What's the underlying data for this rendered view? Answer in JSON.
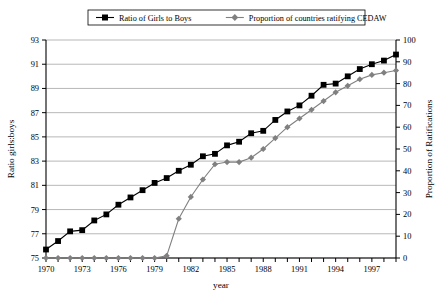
{
  "chart_data": {
    "type": "line",
    "title": "",
    "xlabel": "year",
    "ylabel": "Ratio girls:boys",
    "y2label": "Proportion of Ratifications",
    "grid": true,
    "legend_position": "top",
    "xlim": [
      1970,
      1999
    ],
    "ylim": [
      75,
      93
    ],
    "y2lim": [
      0,
      100
    ],
    "ytick_step": 2,
    "y2tick_step": 10,
    "xtick_step": 1,
    "xlabel_step": 3,
    "x": [
      1970,
      1971,
      1972,
      1973,
      1974,
      1975,
      1976,
      1977,
      1978,
      1979,
      1980,
      1981,
      1982,
      1983,
      1984,
      1985,
      1986,
      1987,
      1988,
      1989,
      1990,
      1991,
      1992,
      1993,
      1994,
      1995,
      1996,
      1997,
      1998,
      1999
    ],
    "xticklabels": [
      "1970",
      "1973",
      "1976",
      "1979",
      "1982",
      "1985",
      "1988",
      "1991",
      "1994",
      "1997"
    ],
    "yticklabels": [
      "75",
      "77",
      "79",
      "81",
      "83",
      "85",
      "87",
      "89",
      "91",
      "93"
    ],
    "y2ticklabels": [
      "0",
      "10",
      "20",
      "30",
      "40",
      "50",
      "60",
      "70",
      "80",
      "90",
      "100"
    ],
    "series": [
      {
        "name": "Ratio of Girls to Boys",
        "axis": "left",
        "color": "#000000",
        "marker": "square",
        "values": [
          75.7,
          76.4,
          77.2,
          77.3,
          78.1,
          78.6,
          79.4,
          80.0,
          80.6,
          81.2,
          81.6,
          82.2,
          82.7,
          83.4,
          83.6,
          84.3,
          84.6,
          85.3,
          85.5,
          86.4,
          87.1,
          87.6,
          88.4,
          89.3,
          89.4,
          90.0,
          90.6,
          91.0,
          91.3,
          91.8
        ]
      },
      {
        "name": "Proportion of countries ratifying CEDAW",
        "axis": "right",
        "color": "#808080",
        "marker": "diamond",
        "values": [
          0,
          0,
          0,
          0,
          0,
          0,
          0,
          0,
          0,
          0,
          1,
          18,
          28,
          36,
          43,
          44,
          44,
          46,
          50,
          55,
          60,
          64,
          68,
          72,
          76,
          79,
          82,
          84,
          85,
          86
        ]
      }
    ]
  },
  "legend": {
    "items": [
      {
        "label": "Ratio of Girls to Boys",
        "marker": "square",
        "color": "#000000"
      },
      {
        "label": "Proportion of countries ratifying CEDAW",
        "marker": "diamond",
        "color": "#808080"
      }
    ]
  }
}
